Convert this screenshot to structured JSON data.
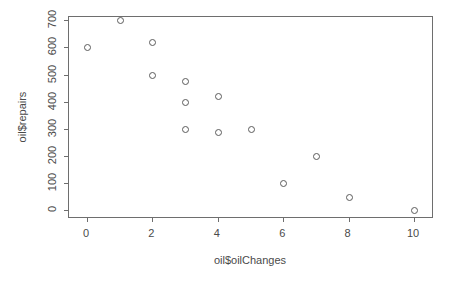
{
  "chart_data": {
    "type": "scatter",
    "title": "",
    "xlabel": "oil$oilChanges",
    "ylabel": "oil$repairs",
    "xlim": [
      -0.55,
      10.55
    ],
    "ylim": [
      -25,
      712
    ],
    "grid": false,
    "legend": null,
    "marker": "open-circle",
    "marker_color": "#5b5b5b",
    "axis_color": "#6e6e6e",
    "background": "#ffffff",
    "xticks": [
      0,
      2,
      4,
      6,
      8,
      10
    ],
    "xtick_labels": [
      "0",
      "2",
      "4",
      "6",
      "8",
      "10"
    ],
    "yticks": [
      0,
      100,
      200,
      300,
      400,
      500,
      600,
      700
    ],
    "ytick_labels": [
      "0",
      "100",
      "200",
      "300",
      "400",
      "500",
      "600",
      "700"
    ],
    "x": [
      0,
      1,
      2,
      2,
      3,
      3,
      3,
      4,
      4,
      5,
      6,
      7,
      8,
      10
    ],
    "y": [
      600,
      700,
      620,
      500,
      475,
      400,
      300,
      420,
      290,
      300,
      100,
      200,
      50,
      0
    ],
    "points": [
      {
        "x": 0,
        "y": 600
      },
      {
        "x": 1,
        "y": 700
      },
      {
        "x": 2,
        "y": 620
      },
      {
        "x": 2,
        "y": 500
      },
      {
        "x": 3,
        "y": 475
      },
      {
        "x": 3,
        "y": 400
      },
      {
        "x": 3,
        "y": 300
      },
      {
        "x": 4,
        "y": 420
      },
      {
        "x": 4,
        "y": 290
      },
      {
        "x": 5,
        "y": 300
      },
      {
        "x": 6,
        "y": 100
      },
      {
        "x": 7,
        "y": 200
      },
      {
        "x": 8,
        "y": 50
      },
      {
        "x": 10,
        "y": 0
      }
    ],
    "n_points": 14
  }
}
